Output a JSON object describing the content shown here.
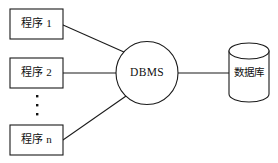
{
  "diagram": {
    "background_color": "#ffffff",
    "stroke_color": "#1a1a1a",
    "text_color": "#111111",
    "program_nodes": [
      {
        "label": "程序 1",
        "shape": "rectangle"
      },
      {
        "label": "程序 2",
        "shape": "rectangle"
      },
      {
        "label": "程序 n",
        "shape": "rectangle"
      }
    ],
    "ellipsis": {
      "label": "⋮",
      "dot_count": 3,
      "orientation": "vertical"
    },
    "dbms_node": {
      "label": "DBMS",
      "shape": "circle"
    },
    "database_node": {
      "label": "数据库",
      "shape": "cylinder"
    },
    "connectors": [
      {
        "from": "程序 1",
        "to": "DBMS",
        "style": "diagonal"
      },
      {
        "from": "程序 2",
        "to": "DBMS",
        "style": "horizontal"
      },
      {
        "from": "程序 n",
        "to": "DBMS",
        "style": "diagonal"
      },
      {
        "from": "DBMS",
        "to": "数据库",
        "style": "horizontal"
      }
    ]
  }
}
